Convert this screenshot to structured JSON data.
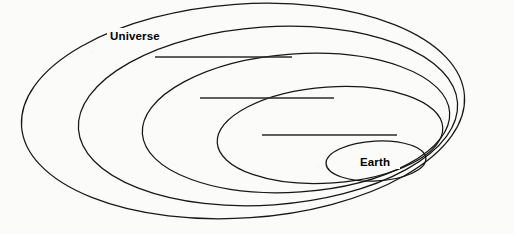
{
  "diagram": {
    "type": "nested-ellipses",
    "background_color": "#fbfbfa",
    "stroke_color": "#171717",
    "rule_color": "#2b2b2b",
    "level_count": 5,
    "levels": [
      {
        "index": 1,
        "position": "outermost",
        "label": "Universe",
        "labeled": true,
        "label_x": 110,
        "label_y": 39,
        "ellipse": {
          "cx": 243,
          "cy": 111,
          "rx": 222,
          "ry": 107,
          "rotation": -4
        }
      },
      {
        "index": 2,
        "position": "second",
        "label": "",
        "labeled": false,
        "blank_line": {
          "x1": 155,
          "y1": 57,
          "x2": 292,
          "y2": 57
        },
        "ellipse": {
          "cx": 268,
          "cy": 116,
          "rx": 190,
          "ry": 89,
          "rotation": -4
        }
      },
      {
        "index": 3,
        "position": "third",
        "label": "",
        "labeled": false,
        "blank_line": {
          "x1": 200,
          "y1": 98,
          "x2": 334,
          "y2": 98
        },
        "ellipse": {
          "cx": 296,
          "cy": 123,
          "rx": 154,
          "ry": 69,
          "rotation": -4
        }
      },
      {
        "index": 4,
        "position": "fourth",
        "label": "",
        "labeled": false,
        "blank_line": {
          "x1": 262,
          "y1": 135,
          "x2": 397,
          "y2": 135
        },
        "ellipse": {
          "cx": 330,
          "cy": 135,
          "rx": 113,
          "ry": 48,
          "rotation": -4
        }
      },
      {
        "index": 5,
        "position": "innermost",
        "label": "Earth",
        "labeled": true,
        "label_x": 375,
        "label_y": 165,
        "ellipse": {
          "cx": 376,
          "cy": 161,
          "rx": 50,
          "ry": 20,
          "rotation": -3
        }
      }
    ],
    "blank_lines": [
      {
        "id": "blank-1",
        "x1": 155,
        "y1": 57,
        "x2": 292,
        "y2": 57
      },
      {
        "id": "blank-2",
        "x1": 200,
        "y1": 98,
        "x2": 334,
        "y2": 98
      },
      {
        "id": "blank-3",
        "x1": 262,
        "y1": 135,
        "x2": 397,
        "y2": 135
      }
    ],
    "labels": {
      "outer": "Universe",
      "inner": "Earth"
    }
  }
}
